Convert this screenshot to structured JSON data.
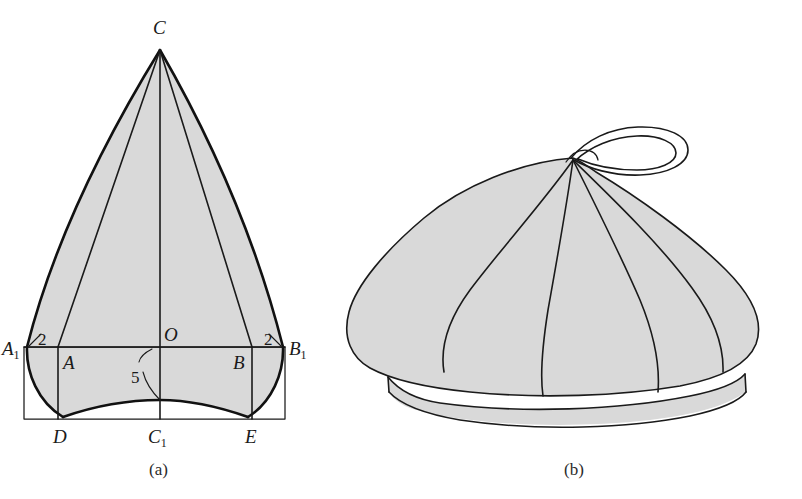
{
  "page": {
    "background_color": "#ffffff",
    "width": 802,
    "height": 499
  },
  "palette": {
    "panel_fill": "#d9d9d9",
    "outline": "#111111",
    "line": "#1a1a1a",
    "text": "#1a1a1a"
  },
  "figures": [
    {
      "id": "figure-a",
      "caption": "(a)",
      "kind": "geometric-pattern-drawing",
      "description": "Ogival (pointed arch) crown panel pattern inscribed in a rectangle",
      "points": [
        {
          "key": "C",
          "label": "C",
          "sub": "",
          "role": "apex"
        },
        {
          "key": "A1",
          "label": "A",
          "sub": "1",
          "role": "rectangle-left-upper"
        },
        {
          "key": "B1",
          "label": "B",
          "sub": "1",
          "role": "rectangle-right-upper"
        },
        {
          "key": "A",
          "label": "A",
          "sub": "",
          "role": "left-inner"
        },
        {
          "key": "B",
          "label": "B",
          "sub": "",
          "role": "right-inner"
        },
        {
          "key": "O",
          "label": "O",
          "sub": "",
          "role": "center"
        },
        {
          "key": "D",
          "label": "D",
          "sub": "",
          "role": "bottom-left"
        },
        {
          "key": "C1",
          "label": "C",
          "sub": "1",
          "role": "bottom-center"
        },
        {
          "key": "E",
          "label": "E",
          "sub": "",
          "role": "bottom-right"
        }
      ],
      "dimensions": [
        {
          "key": "left-gap",
          "value": "2",
          "position": "upper-left-corner"
        },
        {
          "key": "right-gap",
          "value": "2",
          "position": "upper-right-corner"
        },
        {
          "key": "rise",
          "value": "5",
          "position": "center-bottom"
        }
      ]
    },
    {
      "id": "figure-b",
      "caption": "(b)",
      "kind": "pictorial-drawing",
      "description": "Finished gored cap with top loop and brim, shown in three-quarter view"
    }
  ]
}
